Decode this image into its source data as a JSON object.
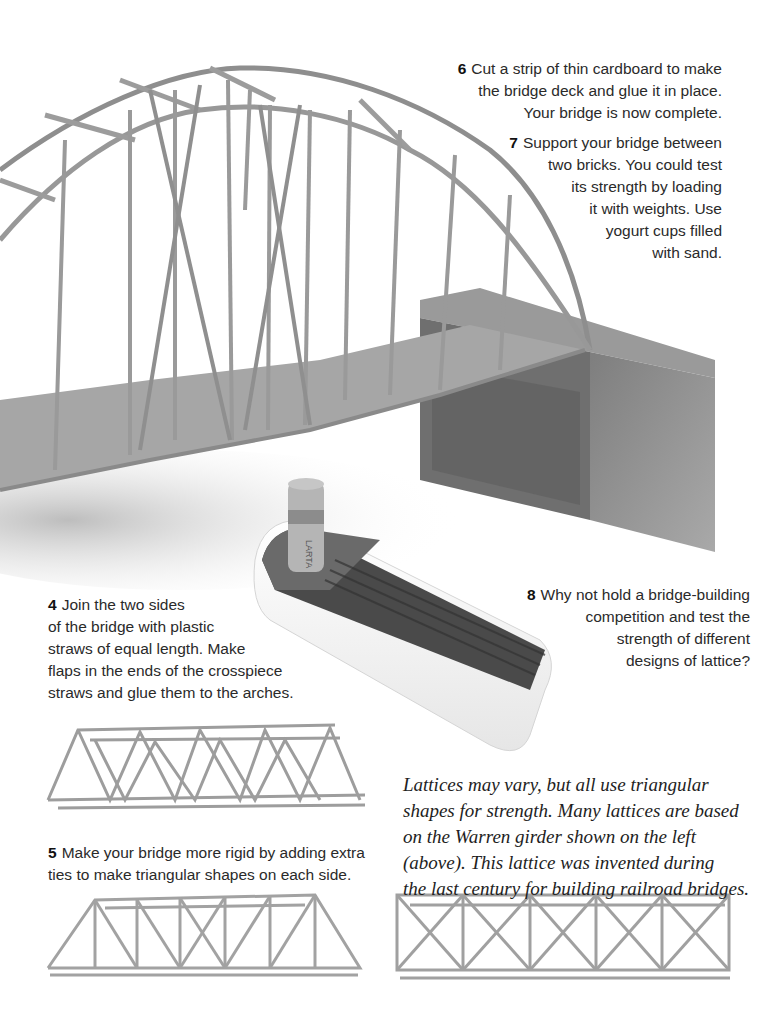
{
  "steps": {
    "s6": {
      "num": "6",
      "lines": [
        "Cut a strip of thin cardboard to make",
        "the bridge deck and glue it in place.",
        "Your bridge is now complete."
      ]
    },
    "s7": {
      "num": "7",
      "lines": [
        "Support your bridge between",
        "two bricks. You could test",
        "its strength by loading",
        "it with weights. Use",
        "yogurt cups filled",
        "with sand."
      ]
    },
    "s8": {
      "num": "8",
      "lines": [
        "Why not hold a bridge-building",
        "competition and test the",
        "strength of different",
        "designs of lattice?"
      ]
    },
    "s4": {
      "num": "4",
      "lines": [
        "Join the two sides",
        "of the bridge with plastic",
        "straws of equal length. Make",
        "flaps in the ends of the crosspiece",
        "straws and glue them to the arches."
      ]
    },
    "s5": {
      "num": "5",
      "lines": [
        "Make your bridge more rigid by adding extra",
        "ties to make triangular shapes on each side."
      ]
    }
  },
  "caption": {
    "lines": [
      "Lattices may vary, but all use triangular",
      "shapes for strength. Many lattices are based",
      "on the Warren girder shown on the left",
      "(above). This lattice was invented during",
      "the last century for building railroad bridges."
    ]
  },
  "images": {
    "arch_bridge": "arch-bridge-photo",
    "brick": "brick-photo",
    "cork_tray": "cork-and-straw-tray-photo",
    "warren_girder": "warren-girder-lattice-photo",
    "rigid_lattice": "rigid-lattice-photo",
    "cross_lattice": "cross-braced-lattice-photo",
    "cork_label": "LARTA"
  },
  "colors": {
    "straw": "#9a9a9a",
    "deck": "#a8a8a8",
    "brick": "#8a8a8a",
    "text": "#2a2a2a"
  }
}
